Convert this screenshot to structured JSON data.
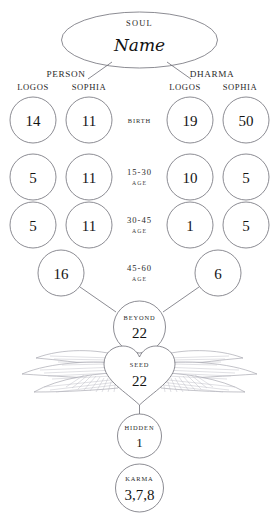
{
  "soul": {
    "caption": "SOUL",
    "name": "Name"
  },
  "branches": [
    {
      "title": "PERSON",
      "columns": [
        "LOGOS",
        "SOPHIA"
      ],
      "rows": [
        {
          "logos": "14",
          "sophia": "11"
        },
        {
          "logos": "5",
          "sophia": "11"
        },
        {
          "logos": "5",
          "sophia": "11"
        }
      ],
      "merge": "16"
    },
    {
      "title": "DHARMA",
      "columns": [
        "LOGOS",
        "SOPHIA"
      ],
      "rows": [
        {
          "logos": "19",
          "sophia": "50"
        },
        {
          "logos": "10",
          "sophia": "5"
        },
        {
          "logos": "1",
          "sophia": "5"
        }
      ],
      "merge": "6"
    }
  ],
  "stages": [
    {
      "range": "BIRTH",
      "word": ""
    },
    {
      "range": "15-30",
      "word": "AGE"
    },
    {
      "range": "30-45",
      "word": "AGE"
    },
    {
      "range": "45-60",
      "word": "AGE"
    }
  ],
  "nodes": {
    "beyond": {
      "caption": "BEYOND",
      "value": "22"
    },
    "seed": {
      "caption": "SEED",
      "value": "22"
    },
    "hidden": {
      "caption": "HIDDEN",
      "value": "1"
    },
    "karma": {
      "caption": "KARMA",
      "value": "3,7,8"
    }
  },
  "colors": {
    "stroke": "#6f6f77",
    "feather": "#b9b9c2",
    "text": "#1c1c1c",
    "background": "#ffffff"
  }
}
